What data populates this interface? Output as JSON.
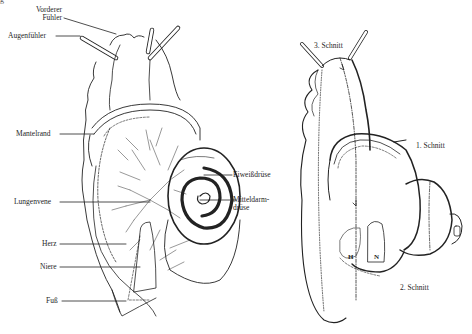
{
  "figure": {
    "corner_mark": "g",
    "left_panel": {
      "labels": [
        {
          "id": "vorderer_fuehler",
          "text_line1": "Vorderer",
          "text_line2": "Fühler"
        },
        {
          "id": "augenfuehler",
          "text": "Augenfühler"
        },
        {
          "id": "mantelrand",
          "text": "Mantelrand"
        },
        {
          "id": "lungenvene",
          "text": "Lungenvene"
        },
        {
          "id": "herz",
          "text": "Herz"
        },
        {
          "id": "niere",
          "text": "Niere"
        },
        {
          "id": "fuss",
          "text": "Fuß"
        },
        {
          "id": "eiweissdruese",
          "text": "Eiweißdrüse"
        },
        {
          "id": "mitteldarmdruese",
          "text_line1": "Mitteldarm-",
          "text_line2": "drüse"
        }
      ]
    },
    "right_panel": {
      "labels": [
        {
          "id": "schnitt3",
          "text": "3. Schnitt"
        },
        {
          "id": "schnitt1",
          "text": "1. Schnitt"
        },
        {
          "id": "schnitt2",
          "text": "2. Schnitt"
        },
        {
          "id": "organ_h",
          "text": "H"
        },
        {
          "id": "organ_n",
          "text": "N"
        }
      ]
    }
  }
}
